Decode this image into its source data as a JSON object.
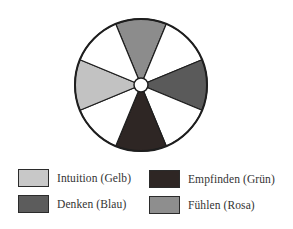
{
  "diagram": {
    "type": "color-wheel",
    "center": [
      141,
      85
    ],
    "radius": 66,
    "hole_radius": 7,
    "sector_count": 8,
    "sectors": [
      {
        "position": "top",
        "function": "Fühlen",
        "color": "#8c8c8c"
      },
      {
        "position": "top-right",
        "function": "",
        "color": "#ffffff"
      },
      {
        "position": "right",
        "function": "Denken",
        "color": "#5a5a5a"
      },
      {
        "position": "bottom-right",
        "function": "",
        "color": "#ffffff"
      },
      {
        "position": "bottom",
        "function": "Empfinden",
        "color": "#2e2624"
      },
      {
        "position": "bottom-left",
        "function": "",
        "color": "#ffffff"
      },
      {
        "position": "left",
        "function": "Intuition",
        "color": "#c2c2c2"
      },
      {
        "position": "top-left",
        "function": "",
        "color": "#ffffff"
      }
    ]
  },
  "legend": {
    "items": [
      {
        "label": "Intuition (Gelb)",
        "color": "#c8c8c8"
      },
      {
        "label": "Denken (Blau)",
        "color": "#5c5c5c"
      },
      {
        "label": "Empfinden (Grün)",
        "color": "#2e2624"
      },
      {
        "label": "Fühlen (Rosa)",
        "color": "#8e8e8e"
      }
    ]
  }
}
